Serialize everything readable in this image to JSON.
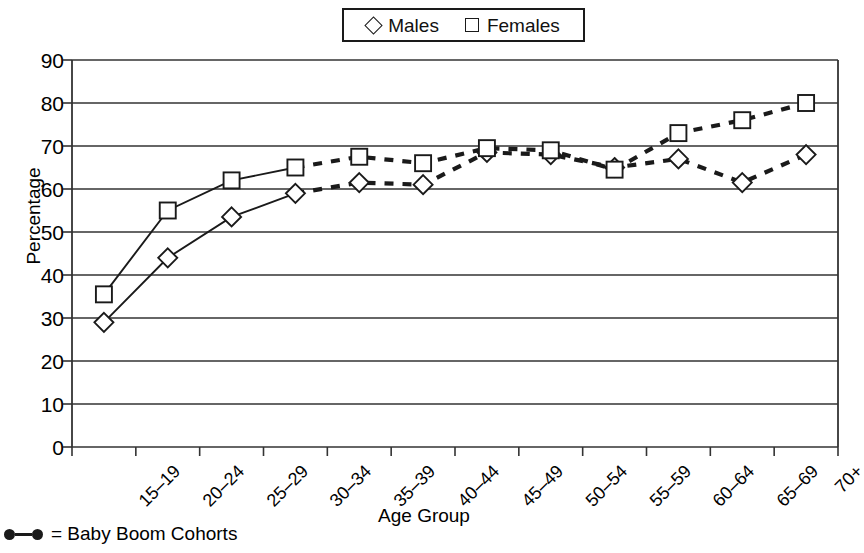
{
  "chart_data": {
    "type": "line",
    "title": "",
    "xlabel": "Age Group",
    "ylabel": "Percentage",
    "ylim": [
      0,
      90
    ],
    "ytick_step": 10,
    "yticks": [
      90,
      80,
      70,
      60,
      50,
      40,
      30,
      20,
      10,
      0
    ],
    "grid": true,
    "legend_position": "top-center",
    "categories": [
      "15–19",
      "20–24",
      "25–29",
      "30–34",
      "35–39",
      "40–44",
      "45–49",
      "50–54",
      "55–59",
      "60–64",
      "65–69",
      "70+"
    ],
    "series": [
      {
        "name": "Males",
        "marker": "diamond",
        "values": [
          29,
          44,
          53.5,
          59,
          61.5,
          61,
          68.5,
          68,
          65,
          67,
          61.5,
          68
        ],
        "solid_through_index": 3,
        "dashed_note": "Dashed segments mark Baby Boom Cohorts (35–39 onward)"
      },
      {
        "name": "Females",
        "marker": "square",
        "values": [
          35.5,
          55,
          62,
          65,
          67.5,
          66,
          69.5,
          69,
          64.5,
          73,
          76,
          80
        ],
        "solid_through_index": 3,
        "dashed_note": "Dashed segments mark Baby Boom Cohorts (35–39 onward)"
      }
    ],
    "footnote": "= Baby Boom Cohorts"
  },
  "legend": {
    "males_label": "Males",
    "females_label": "Females"
  },
  "axes": {
    "y_title": "Percentage",
    "x_title": "Age Group"
  },
  "colors": {
    "line": "#1a1a1a",
    "marker_fill": "#ffffff",
    "grid": "#333333",
    "background": "#ffffff"
  }
}
